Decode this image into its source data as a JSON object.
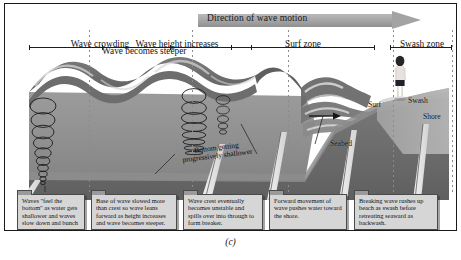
{
  "figure": {
    "caption": "(c)",
    "direction_arrow_label": "Direction of wave motion"
  },
  "zones": [
    {
      "id": "wave-crowding",
      "label": "Wave crowding",
      "sub": ""
    },
    {
      "id": "wave-height",
      "label": "Wave height increases",
      "sub": "Wave becomes steeper"
    },
    {
      "id": "surf-zone",
      "label": "Surf zone",
      "sub": ""
    },
    {
      "id": "swash-zone",
      "label": "Swash zone",
      "sub": ""
    }
  ],
  "scene_labels": {
    "bottom_getting_shallower": "Bottom getting progressively shallower",
    "seabed": "Seabed",
    "surf": "Surf",
    "swash": "Swash",
    "shore": "Shore"
  },
  "callouts": [
    {
      "id": "callout-feel-bottom",
      "text": "Waves \"feel the bottom\" as water gets shallower and waves slow down and bunch together."
    },
    {
      "id": "callout-base-slowed",
      "text": "Base of wave slowed more than crest so wave leans forward as height increases and wave becomes steeper."
    },
    {
      "id": "callout-crest-unstable",
      "text": "Wave crest eventually becomes unstable and spills over into through to form breaker."
    },
    {
      "id": "callout-forward-movement",
      "text": "Forward movement of wave pushes water toward the shore."
    },
    {
      "id": "callout-swash-backwash",
      "text": "Breaking wave rushes up beach as swash before retreating seaward as backwash."
    }
  ],
  "colors": {
    "water_surface": "#6f6f6f",
    "water_body": "#8e8e8e",
    "seabed": "#6a6a6a",
    "beach": "#9d9d9d",
    "arrow": "#a3a3a3",
    "callout_bg": "#d6d6d6",
    "frame": "#1a1a1a"
  }
}
